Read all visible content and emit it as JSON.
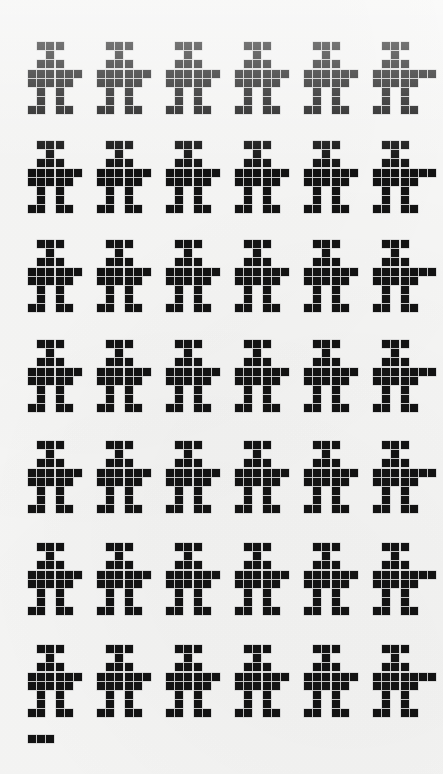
{
  "artwork": {
    "title": "Dot-matrix people grid",
    "description": "Repeated pixel-art human figures printed as a dot matrix on off-white paper",
    "background_color": "#f6f6f5",
    "ink_color": "#131313",
    "canvas": {
      "width": 443,
      "height": 774
    }
  },
  "grid": {
    "rows": 7,
    "columns": 6,
    "total_figures": 42,
    "figure_origin_x": 28,
    "figure_origin_y": 42,
    "column_pitch": 69,
    "row_pitch": 99,
    "cell_size": 8,
    "cell_pitch": 9.2
  },
  "figure": {
    "name": "person-glyph",
    "grid_width": 7,
    "grid_height": 9,
    "pattern": [
      [
        0,
        1,
        1,
        1,
        0,
        0,
        0
      ],
      [
        0,
        0,
        1,
        0,
        0,
        0,
        0
      ],
      [
        0,
        1,
        1,
        1,
        0,
        0,
        0
      ],
      [
        1,
        1,
        1,
        1,
        1,
        1,
        0
      ],
      [
        1,
        1,
        1,
        1,
        1,
        0,
        0
      ],
      [
        0,
        1,
        0,
        1,
        0,
        0,
        0
      ],
      [
        0,
        1,
        0,
        1,
        0,
        0,
        0
      ],
      [
        1,
        1,
        0,
        1,
        1,
        0,
        0
      ],
      [
        0,
        0,
        0,
        0,
        0,
        0,
        0
      ]
    ],
    "parts": [
      "head",
      "neck",
      "shoulders",
      "arms",
      "torso",
      "legs",
      "legs",
      "feet"
    ]
  },
  "variants": {
    "extended_arm_column_index": 5,
    "extended_arm_cell": [
      3,
      6
    ],
    "note": "Every sixth figure in each row carries one extra arm pixel to the right"
  },
  "fragment": {
    "name": "row-eight-fragment",
    "x": 28,
    "y": 735,
    "cells": [
      [
        0,
        0
      ],
      [
        0,
        1
      ],
      [
        0,
        2
      ]
    ],
    "description": "Three-cell start of an eighth, clipped row"
  },
  "rows": [
    {
      "label": "row-1",
      "y": 42,
      "figures": 6
    },
    {
      "label": "row-2",
      "y": 141,
      "figures": 6
    },
    {
      "label": "row-3",
      "y": 240,
      "figures": 6
    },
    {
      "label": "row-4",
      "y": 340,
      "figures": 6
    },
    {
      "label": "row-5",
      "y": 441,
      "figures": 6
    },
    {
      "label": "row-6",
      "y": 543,
      "figures": 6
    },
    {
      "label": "row-7",
      "y": 645,
      "figures": 6
    }
  ]
}
